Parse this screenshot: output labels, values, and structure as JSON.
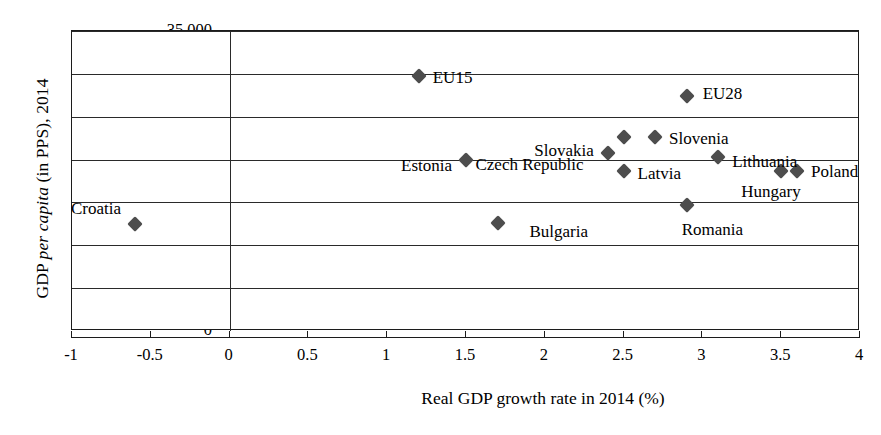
{
  "chart_data": {
    "type": "scatter",
    "title": "",
    "xlabel": "Real GDP growth rate in 2014 (%)",
    "ylabel": "GDP per capita (in PPS), 2014",
    "ylabel_parts": {
      "prefix": "GDP ",
      "italic": "per capita",
      "suffix": " (in PPS), 2014"
    },
    "xlim": [
      -1,
      4
    ],
    "ylim": [
      0,
      35000
    ],
    "xticks": [
      -1,
      -0.5,
      0,
      0.5,
      1,
      1.5,
      2,
      2.5,
      3,
      3.5,
      4
    ],
    "xtick_labels": [
      "-1",
      "-0.5",
      "0",
      "0.5",
      "1",
      "1.5",
      "2",
      "2.5",
      "3",
      "3.5",
      "4"
    ],
    "yticks": [
      0,
      5000,
      10000,
      15000,
      20000,
      25000,
      30000,
      35000
    ],
    "ytick_labels": [
      "0",
      "5,000",
      "10,000",
      "15,000",
      "20,000",
      "25,000",
      "30,000",
      "35,000"
    ],
    "grid": "horizontal",
    "legend": "none",
    "marker": "diamond",
    "marker_color": "#4d4d4d",
    "points": [
      {
        "label": "Croatia",
        "x": -0.6,
        "y": 12500,
        "label_side": "right",
        "label_dx": -14,
        "label_dy": -16
      },
      {
        "label": "EU15",
        "x": 1.2,
        "y": 29800,
        "label_side": "left",
        "label_dx": 14,
        "label_dy": 1
      },
      {
        "label": "Estonia",
        "x": 1.5,
        "y": 20000,
        "label_side": "right",
        "label_dx": -14,
        "label_dy": 5
      },
      {
        "label": "Bulgaria",
        "x": 1.7,
        "y": 12600,
        "label_side": "left",
        "label_dx": 32,
        "label_dy": 8
      },
      {
        "label": "Slovakia",
        "x": 2.4,
        "y": 20800,
        "label_side": "right",
        "label_dx": -14,
        "label_dy": -3
      },
      {
        "label": "Czech Republic",
        "x": 2.5,
        "y": 22600,
        "label_side": "right",
        "label_dx": -40,
        "label_dy": 27
      },
      {
        "label": "Slovenia",
        "x": 2.7,
        "y": 22600,
        "label_side": "left",
        "label_dx": 14,
        "label_dy": 1
      },
      {
        "label": "EU28",
        "x": 2.9,
        "y": 27400,
        "label_side": "left",
        "label_dx": 16,
        "label_dy": -3
      },
      {
        "label": "Romania",
        "x": 2.9,
        "y": 14700,
        "label_side": "left",
        "label_dx": -5,
        "label_dy": 24
      },
      {
        "label": "Latvia",
        "x": 2.5,
        "y": 18700,
        "label_side": "left",
        "label_dx": 14,
        "label_dy": 2
      },
      {
        "label": "Lithuania",
        "x": 3.1,
        "y": 20300,
        "label_side": "left",
        "label_dx": 14,
        "label_dy": 4
      },
      {
        "label": "Hungary",
        "x": 3.5,
        "y": 18700,
        "label_side": "left",
        "label_dx": -40,
        "label_dy": 20
      },
      {
        "label": "Poland",
        "x": 3.6,
        "y": 18700,
        "label_side": "left",
        "label_dx": 14,
        "label_dy": 0
      }
    ]
  }
}
